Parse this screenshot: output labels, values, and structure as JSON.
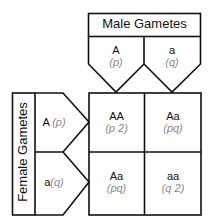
{
  "diagram": {
    "type": "punnett-square",
    "male_header": "Male Gametes",
    "female_header": "Female Gametes",
    "male_gametes": [
      {
        "allele": "A",
        "freq": "(p)"
      },
      {
        "allele": "a",
        "freq": "(q)"
      }
    ],
    "female_gametes": [
      {
        "allele": "A",
        "freq": "(p)"
      },
      {
        "allele": "a",
        "freq": "(q)"
      }
    ],
    "cells": [
      [
        {
          "genotype": "AA",
          "freq": "(p 2)"
        },
        {
          "genotype": "Aa",
          "freq": "(pq)"
        }
      ],
      [
        {
          "genotype": "Aa",
          "freq": "(pq)"
        },
        {
          "genotype": "aa",
          "freq": "(q 2)"
        }
      ]
    ],
    "colors": {
      "line": "#111111",
      "freq_text": "#888888"
    }
  }
}
